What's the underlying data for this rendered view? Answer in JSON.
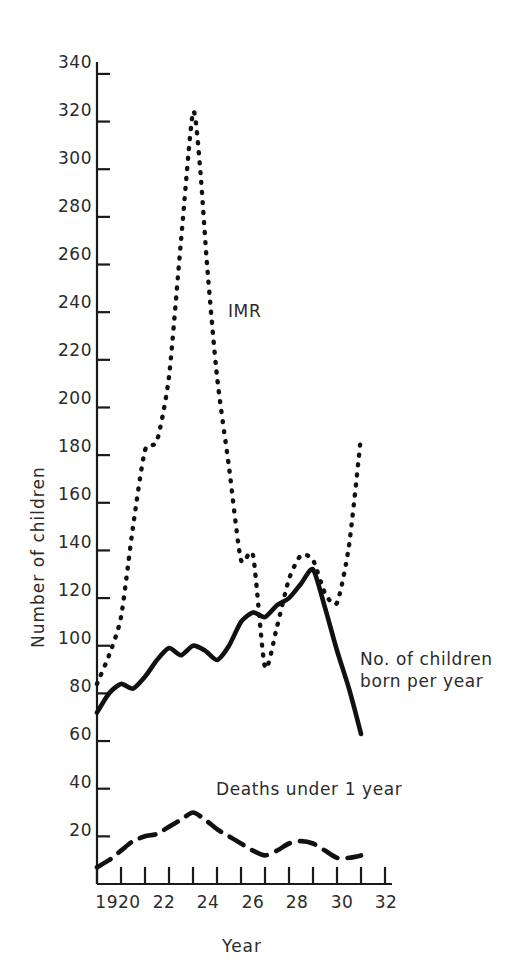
{
  "chart_data": {
    "type": "line",
    "title": "",
    "xlabel": "Year",
    "ylabel": "Number of children",
    "xlim": [
      1920,
      1932
    ],
    "ylim": [
      0,
      345
    ],
    "grid": false,
    "legend_position": "inline-annotations",
    "x_tick_labels": [
      "1920",
      "22",
      "24",
      "26",
      "28",
      "30",
      "32"
    ],
    "x_tick_values": [
      1920,
      1922,
      1924,
      1926,
      1928,
      1930,
      1932
    ],
    "x_minor_tick_values": [
      1921,
      1923,
      1925,
      1927,
      1929,
      1931
    ],
    "y_tick_labels": [
      "20",
      "40",
      "60",
      "80",
      "100",
      "120",
      "140",
      "160",
      "180",
      "200",
      "220",
      "240",
      "260",
      "280",
      "300",
      "320",
      "340"
    ],
    "y_tick_values": [
      20,
      40,
      60,
      80,
      100,
      120,
      140,
      160,
      180,
      200,
      220,
      240,
      260,
      280,
      300,
      320,
      340
    ],
    "series": [
      {
        "name": "IMR",
        "label": "IMR",
        "style": "dotted",
        "color": "#111111",
        "x": [
          1920,
          1920.5,
          1921,
          1921.5,
          1922,
          1922.5,
          1923,
          1923.5,
          1924,
          1924.3,
          1924.6,
          1925,
          1925.5,
          1926,
          1926.5,
          1927,
          1927.5,
          1928,
          1928.5,
          1929,
          1929.5,
          1930,
          1930.5,
          1931
        ],
        "y": [
          84,
          96,
          112,
          150,
          182,
          186,
          213,
          270,
          324,
          300,
          258,
          213,
          175,
          136,
          138,
          91,
          108,
          128,
          138,
          136,
          122,
          118,
          142,
          188
        ]
      },
      {
        "name": "No. of children born per year",
        "label": "No. of children\nborn per year",
        "style": "solid",
        "color": "#111111",
        "x": [
          1920,
          1920.5,
          1921,
          1921.5,
          1922,
          1922.5,
          1923,
          1923.5,
          1924,
          1924.5,
          1925,
          1925.5,
          1926,
          1926.5,
          1927,
          1927.5,
          1928,
          1928.5,
          1929,
          1929.5,
          1930,
          1930.5,
          1931
        ],
        "y": [
          72,
          80,
          84,
          82,
          87,
          94,
          99,
          96,
          100,
          98,
          94,
          100,
          110,
          114,
          112,
          117,
          120,
          126,
          132,
          116,
          98,
          82,
          63
        ]
      },
      {
        "name": "Deaths under 1 year",
        "label": "Deaths under 1 year",
        "style": "dashed",
        "color": "#111111",
        "x": [
          1920,
          1920.5,
          1921,
          1921.5,
          1922,
          1922.5,
          1923,
          1923.5,
          1924,
          1924.5,
          1925,
          1925.5,
          1926,
          1926.5,
          1927,
          1927.5,
          1928,
          1928.5,
          1929,
          1929.5,
          1930,
          1930.5,
          1931
        ],
        "y": [
          7,
          10,
          14,
          18,
          20,
          21,
          24,
          27,
          30,
          27,
          23,
          20,
          17,
          14,
          12,
          14,
          17,
          18,
          17,
          14,
          11,
          11,
          12
        ]
      }
    ],
    "annotations": [
      {
        "text": "IMR",
        "x": 1924.9,
        "y": 231
      },
      {
        "text": "No. of children",
        "x": 1930.9,
        "y": 101
      },
      {
        "text": "born per year",
        "x": 1930.9,
        "y": 92
      },
      {
        "text": "Deaths under 1 year",
        "x": 1926.4,
        "y": 35
      }
    ]
  },
  "axis": {
    "x_title": "Year",
    "y_title": "Number of children",
    "origin_label": "1920"
  },
  "colors": {
    "ink": "#1a1a1a",
    "background": "#ffffff"
  }
}
